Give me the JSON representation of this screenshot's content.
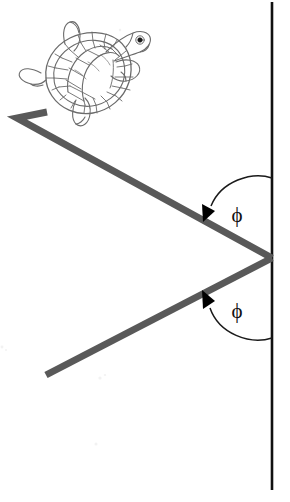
{
  "figure": {
    "background_color": "#ffffff",
    "width": 290,
    "height": 502
  },
  "labels": {
    "angle_incident": "ϕ",
    "angle_reflected": "ϕ"
  },
  "colors": {
    "ray": "#595959",
    "mirror_line": "#111111",
    "arrow": "#000000",
    "turtle_outline": "#6b6b6b",
    "turtle_eye": "#1a1a1a",
    "label_text": "#111111"
  },
  "diagram_data": {
    "type": "geometry",
    "vertical_line": {
      "x": 272,
      "y_top": 2,
      "y_bottom": 490
    },
    "vertex": {
      "x": 272,
      "y": 258
    },
    "incident_ray": {
      "name": "incoming-ray",
      "points": [
        [
          47,
          112
        ],
        [
          17,
          118
        ],
        [
          272,
          258
        ]
      ],
      "stroke_width": 7
    },
    "reflected_ray": {
      "name": "outgoing-ray",
      "points": [
        [
          272,
          258
        ],
        [
          46,
          375
        ]
      ],
      "stroke_width": 7
    },
    "angle_arcs": [
      {
        "name": "incident-angle-arc",
        "from_point": [
          272,
          178
        ],
        "to_point": [
          207,
          213
        ],
        "label": "ϕ",
        "label_pos": [
          237,
          222
        ],
        "arrow_direction": "down-left"
      },
      {
        "name": "reflected-angle-arc",
        "from_point": [
          272,
          338
        ],
        "to_point": [
          206,
          300
        ],
        "label": "ϕ",
        "label_pos": [
          237,
          318
        ],
        "arrow_direction": "up-left"
      }
    ],
    "turtle": {
      "name": "turtle-illustration",
      "center": [
        83,
        72
      ],
      "heading": "upper-right",
      "shell_scutes": true
    }
  }
}
